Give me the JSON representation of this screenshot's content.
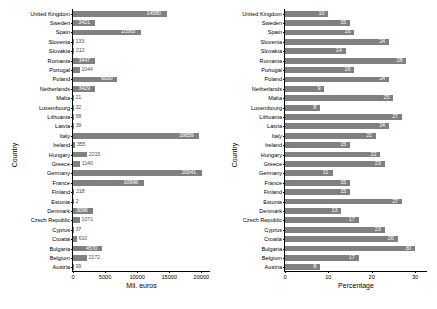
{
  "chart_data": [
    {
      "type": "bar",
      "orientation": "horizontal",
      "title": "",
      "xlabel": "Mil. euros",
      "ylabel": "Country",
      "xlim": [
        0,
        21500
      ],
      "xticks": [
        0,
        5000,
        10000,
        15000,
        20000
      ],
      "xticklabels": [
        "0",
        "5000",
        "10000",
        "15000",
        "20000"
      ],
      "grid": false,
      "bar_color": "#808080",
      "categories": [
        "United Kingdom",
        "Sweden",
        "Spain",
        "Slovenia",
        "Slovakia",
        "Romania",
        "Portugal",
        "Poland",
        "Netherlands",
        "Malta",
        "Luxembourg",
        "Lithuania",
        "Latvia",
        "Italy",
        "Ireland",
        "Hungary",
        "Greece",
        "Germany",
        "France",
        "Finland",
        "Estonia",
        "Denmark",
        "Czech Republic",
        "Cyprus",
        "Croatia",
        "Bulgaria",
        "Belgium",
        "Austria"
      ],
      "values": [
        14580,
        3421,
        10565,
        133,
        212,
        3447,
        1044,
        6930,
        3429,
        21,
        32,
        58,
        39,
        19659,
        355,
        2215,
        1140,
        20041,
        10996,
        218,
        2,
        3096,
        1071,
        37,
        610,
        4570,
        2172,
        99
      ],
      "labels": [
        "14580",
        "3421",
        "10565",
        "133",
        "212",
        "3447",
        "1044",
        "6930",
        "3429",
        "21",
        "32",
        "58",
        "39",
        "19659",
        "355",
        "2215",
        "1140",
        "20041",
        "10996",
        "218",
        "2",
        "3096",
        "1071",
        "37",
        "610",
        "4570",
        "2172",
        "99"
      ]
    },
    {
      "type": "bar",
      "orientation": "horizontal",
      "title": "",
      "xlabel": "Percentage",
      "ylabel": "Country",
      "xlim": [
        0,
        33
      ],
      "xticks": [
        0,
        10,
        20,
        30
      ],
      "xticklabels": [
        "0",
        "10",
        "20",
        "30"
      ],
      "grid": false,
      "bar_color": "#808080",
      "categories": [
        "United Kingdom",
        "Sweden",
        "Spain",
        "Slovenia",
        "Slovakia",
        "Romania",
        "Portugal",
        "Poland",
        "Netherlands",
        "Malta",
        "Luxembourg",
        "Lithuania",
        "Latvia",
        "Italy",
        "Ireland",
        "Hungary",
        "Greece",
        "Germany",
        "France",
        "Finland",
        "Estonia",
        "Denmark",
        "Czech Republic",
        "Cyprus",
        "Croatia",
        "Bulgaria",
        "Belgium",
        "Austria"
      ],
      "values": [
        10,
        15,
        16,
        24,
        14,
        28,
        16,
        24,
        9,
        25,
        8,
        27,
        24,
        21,
        15,
        22,
        23,
        11,
        15,
        15,
        27,
        13,
        17,
        23,
        26,
        30,
        17,
        8
      ],
      "labels": [
        "10",
        "15",
        "16",
        "24",
        "14",
        "28",
        "16",
        "24",
        "9",
        "25",
        "8",
        "27",
        "24",
        "21",
        "15",
        "22",
        "23",
        "11",
        "15",
        "15",
        "27",
        "13",
        "17",
        "23",
        "26",
        "30",
        "17",
        "8"
      ]
    }
  ]
}
